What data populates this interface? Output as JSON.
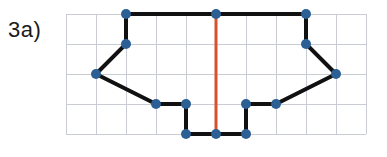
{
  "figure": {
    "label": "3a)",
    "background_color": "#ffffff"
  },
  "grid": {
    "x0": 66,
    "y0": 14,
    "cell_size": 30,
    "cols": 10,
    "rows": 4,
    "line_color": "#c9cdd3",
    "line_width": 1
  },
  "shape": {
    "stroke_color": "#111111",
    "stroke_width": 4,
    "fill": "none",
    "closed": true,
    "points": [
      [
        126,
        14
      ],
      [
        216,
        14
      ],
      [
        306,
        14
      ],
      [
        306,
        44
      ],
      [
        336,
        74
      ],
      [
        276,
        104
      ],
      [
        246,
        104
      ],
      [
        246,
        134
      ],
      [
        216,
        134
      ],
      [
        186,
        134
      ],
      [
        186,
        104
      ],
      [
        156,
        104
      ],
      [
        96,
        74
      ],
      [
        126,
        44
      ]
    ]
  },
  "vertices": {
    "color": "#2c5f94",
    "radius": 5,
    "points": [
      [
        126,
        14
      ],
      [
        216,
        14
      ],
      [
        306,
        14
      ],
      [
        306,
        44
      ],
      [
        336,
        74
      ],
      [
        276,
        104
      ],
      [
        246,
        104
      ],
      [
        246,
        134
      ],
      [
        216,
        134
      ],
      [
        186,
        134
      ],
      [
        186,
        104
      ],
      [
        156,
        104
      ],
      [
        96,
        74
      ],
      [
        126,
        44
      ]
    ]
  },
  "symmetry_line": {
    "color": "#d9512c",
    "width": 3,
    "x": 216,
    "y_top": 14,
    "y_bottom": 134
  }
}
